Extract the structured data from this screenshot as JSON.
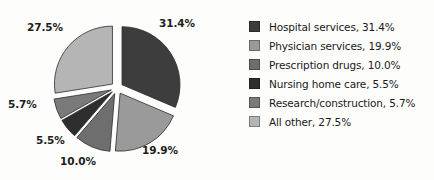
{
  "chart_data": {
    "type": "pie",
    "title": "",
    "subtitle": "",
    "xlabel": "",
    "ylabel": "",
    "legend_position": "right",
    "grid": false,
    "exploded": true,
    "categories": [
      "Hospital services",
      "Physician services",
      "Prescription drugs",
      "Nursing home care",
      "Research/construction",
      "All other"
    ],
    "values": [
      31.4,
      19.9,
      10.0,
      5.5,
      5.7,
      27.5
    ],
    "value_labels": [
      "31.4%",
      "19.9%",
      "10.0%",
      "5.5%",
      "5.7%",
      "27.5%"
    ],
    "colors": [
      "#3d3d3d",
      "#9a9a9a",
      "#6e6e6e",
      "#2e2e2e",
      "#7a7a7a",
      "#b5b5b5"
    ],
    "legend_entries": [
      "Hospital services, 31.4%",
      "Physician services, 19.9%",
      "Prescription drugs, 10.0%",
      "Nursing home care, 5.5%",
      "Research/construction, 5.7%",
      "All other, 27.5%"
    ]
  },
  "pie": {
    "labels": {
      "hospital": "31.4%",
      "physician": "19.9%",
      "drugs": "10.0%",
      "nursing": "5.5%",
      "research": "5.7%",
      "other": "27.5%"
    }
  },
  "legend": {
    "items": [
      {
        "label": "Hospital services, 31.4%",
        "color": "#3d3d3d"
      },
      {
        "label": "Physician services, 19.9%",
        "color": "#9a9a9a"
      },
      {
        "label": "Prescription drugs, 10.0%",
        "color": "#6e6e6e"
      },
      {
        "label": "Nursing home care, 5.5%",
        "color": "#2e2e2e"
      },
      {
        "label": "Research/construction, 5.7%",
        "color": "#7a7a7a"
      },
      {
        "label": "All other, 27.5%",
        "color": "#b5b5b5"
      }
    ]
  },
  "colors": {
    "background": "#fdfdfc",
    "text": "#1a1a1a"
  }
}
